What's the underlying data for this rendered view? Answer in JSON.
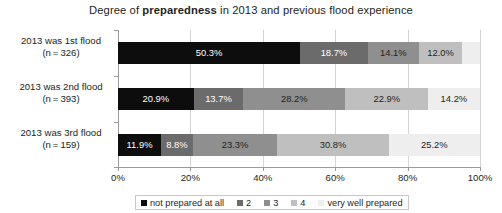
{
  "chart_data": {
    "type": "bar",
    "orientation": "horizontal",
    "stacked": true,
    "normalized_percent": true,
    "title": "Degree of preparedness in 2013 and previous flood experience",
    "title_plain_before": "Degree of ",
    "title_emphasis": "preparedness",
    "title_plain_after": " in 2013 and previous flood experience",
    "xlabel": "",
    "ylabel": "",
    "xlim": [
      0,
      100
    ],
    "xticks": [
      0,
      20,
      40,
      60,
      80,
      100
    ],
    "xtick_labels": [
      "0%",
      "20%",
      "40%",
      "60%",
      "80%",
      "100%"
    ],
    "grid": true,
    "grid_axis": "x",
    "legend_position": "bottom",
    "categories": [
      "2013 was 1st flood (n = 326)",
      "2013 was 2nd flood (n = 393)",
      "2013 was 3rd flood (n = 159)"
    ],
    "category_lines": [
      [
        "2013 was 1st flood",
        "(n = 326)"
      ],
      [
        "2013 was 2nd flood",
        "(n = 393)"
      ],
      [
        "2013 was 3rd flood",
        "(n = 159)"
      ]
    ],
    "sample_sizes": [
      326,
      393,
      159
    ],
    "series": [
      {
        "name": "not prepared at all",
        "color": "#0d0d0d",
        "values": [
          50.3,
          20.9,
          11.9
        ]
      },
      {
        "name": "2",
        "color": "#6b6b6b",
        "values": [
          18.7,
          13.7,
          8.8
        ]
      },
      {
        "name": "3",
        "color": "#8f8f8f",
        "values": [
          14.1,
          28.2,
          23.3
        ]
      },
      {
        "name": "4",
        "color": "#bfbfbf",
        "values": [
          12.0,
          22.9,
          30.8
        ]
      },
      {
        "name": "very well prepared",
        "color": "#eeeeee",
        "values": [
          4.9,
          14.2,
          25.2
        ]
      }
    ],
    "data_labels": [
      [
        "50.3%",
        "18.7%",
        "14.1%",
        "12.0%",
        ""
      ],
      [
        "20.9%",
        "13.7%",
        "28.2%",
        "22.9%",
        "14.2%"
      ],
      [
        "11.9%",
        "8.8%",
        "23.3%",
        "30.8%",
        "25.2%"
      ]
    ],
    "label_text_color_on_dark": "#ffffff",
    "label_text_color_on_light": "#231f20",
    "axis_color": "#9a9a9a",
    "gridline_color": "#d4d4d4",
    "background": "#ffffff"
  },
  "legend": {
    "items": [
      {
        "label": "not prepared at all",
        "color": "#0d0d0d"
      },
      {
        "label": "2",
        "color": "#6b6b6b"
      },
      {
        "label": "3",
        "color": "#8f8f8f"
      },
      {
        "label": "4",
        "color": "#bfbfbf"
      },
      {
        "label": "very well prepared",
        "color": "#eeeeee"
      }
    ]
  }
}
